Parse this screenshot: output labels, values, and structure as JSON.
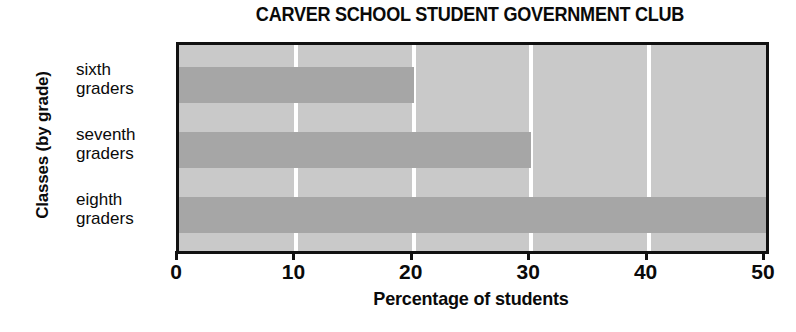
{
  "chart_data": {
    "type": "bar",
    "orientation": "horizontal",
    "title": "CARVER SCHOOL STUDENT GOVERNMENT CLUB",
    "categories": [
      "sixth graders",
      "seventh graders",
      "eighth graders"
    ],
    "category_lines": [
      {
        "line1": "sixth",
        "line2": "graders"
      },
      {
        "line1": "seventh",
        "line2": "graders"
      },
      {
        "line1": "eighth",
        "line2": "graders"
      }
    ],
    "values": [
      20,
      30,
      50
    ],
    "xlabel": "Percentage of students",
    "ylabel": "Classes (by grade)",
    "xlim": [
      0,
      50
    ],
    "xticks": [
      0,
      10,
      20,
      30,
      40,
      50
    ],
    "xtick_labels": [
      "0",
      "10",
      "20",
      "30",
      "40",
      "50"
    ],
    "gridlines": [
      10,
      20,
      30,
      40
    ],
    "grid": true,
    "legend": null,
    "colors": {
      "bar_fill": "#a6a6a6",
      "plot_background": "#c9c9c9",
      "gridline": "#ffffff",
      "axis": "#111111",
      "text": "#0a0a0a",
      "page_background": "#ffffff"
    }
  }
}
